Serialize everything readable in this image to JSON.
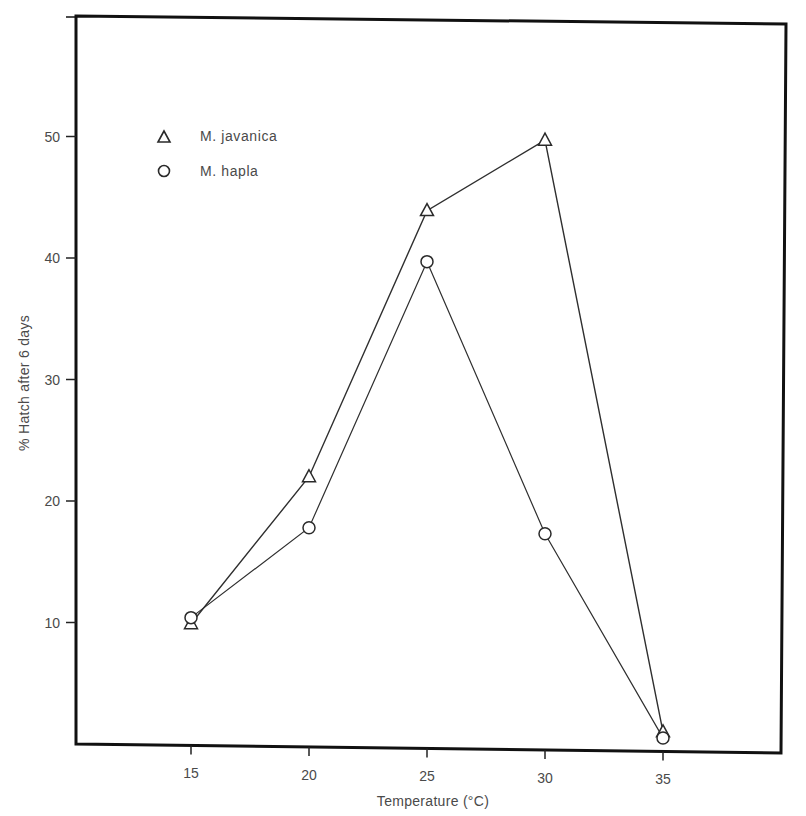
{
  "chart_data": {
    "type": "line",
    "title": "",
    "xlabel": "Temperature (°C)",
    "ylabel": "% Hatch after 6 days",
    "x": [
      15,
      20,
      25,
      30,
      35
    ],
    "x_ticks": [
      "15",
      "20",
      "25",
      "30",
      "35"
    ],
    "y_ticks": [
      "10",
      "20",
      "30",
      "40",
      "50"
    ],
    "xlim": [
      10,
      40
    ],
    "ylim": [
      0,
      53
    ],
    "grid": false,
    "legend_position": "upper-left",
    "series": [
      {
        "name": "M. javanica",
        "marker": "triangle",
        "values": [
          9.9,
          22.0,
          43.9,
          49.7,
          1.0
        ]
      },
      {
        "name": "M. hapla",
        "marker": "circle",
        "values": [
          10.4,
          17.8,
          39.7,
          17.3,
          0.5
        ]
      }
    ]
  },
  "legend": {
    "items": [
      {
        "label": "M. javanica",
        "marker": "triangle-icon"
      },
      {
        "label": "M. hapla",
        "marker": "circle-icon"
      }
    ]
  },
  "colors": {
    "line": "#3a3a3a",
    "frame": "#111111",
    "text": "#4a4a4a"
  }
}
